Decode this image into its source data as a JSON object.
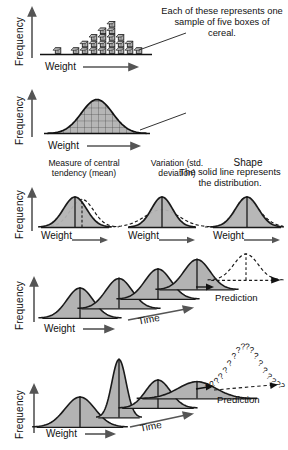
{
  "figure": {
    "title_hidden": "",
    "axis_labels": {
      "frequency": "Frequency",
      "weight": "Weight",
      "time": "Time"
    },
    "colors": {
      "curve_fill": "#b3b3b3",
      "curve_stroke": "#1a1a1a",
      "block_fill": "#b0b0b0",
      "text": "#111111",
      "background": "#ffffff"
    }
  },
  "panels": [
    {
      "id": "panel-histogram-blocks",
      "ylabel": "Frequency",
      "xlabel": "Weight",
      "caption": "Each of these represents one sample of five boxes of cereal.",
      "chart_data": {
        "type": "bar",
        "title": "",
        "xlabel": "Weight",
        "ylabel": "Frequency",
        "categories": [
          "1",
          "2",
          "3",
          "4",
          "5",
          "6",
          "7",
          "8",
          "9",
          "10",
          "11"
        ],
        "values": [
          0,
          1,
          0,
          1,
          2,
          3,
          4,
          5,
          3,
          2,
          1
        ],
        "unit": "blocks",
        "grid": false,
        "note": "each block = one sample of five boxes"
      }
    },
    {
      "id": "panel-distribution-curve",
      "ylabel": "Frequency",
      "xlabel": "Weight",
      "caption": "The solid line represents the distribution.",
      "chart_data": {
        "type": "area",
        "title": "",
        "xlabel": "Weight",
        "ylabel": "Frequency",
        "x": [
          0,
          1,
          2,
          3,
          4,
          5,
          6,
          7,
          8,
          9,
          10,
          11,
          12
        ],
        "values": [
          0.02,
          0.06,
          0.16,
          0.34,
          0.62,
          0.88,
          1.0,
          0.88,
          0.62,
          0.34,
          0.16,
          0.06,
          0.02
        ],
        "grid": true,
        "note": "normal distribution over gridded histogram"
      }
    },
    {
      "id": "panel-three-properties",
      "ylabel": "Frequency",
      "subpanels": [
        {
          "id": "subpanel-central-tendency",
          "heading": "Measure of central tendency (mean)",
          "xlabel": "Weight",
          "chart_data": {
            "type": "line",
            "title": "Measure of central tendency (mean)",
            "xlabel": "Weight",
            "ylabel": "Frequency",
            "series": [
              {
                "name": "solid",
                "mean": 0,
                "sd": 1,
                "style": "solid",
                "filled": true
              },
              {
                "name": "dashed",
                "mean": 0.45,
                "sd": 1,
                "style": "dashed",
                "filled": false
              }
            ]
          }
        },
        {
          "id": "subpanel-variation",
          "heading": "Variation (std. deviation)",
          "xlabel": "Weight",
          "chart_data": {
            "type": "line",
            "title": "Variation (std. deviation)",
            "xlabel": "Weight",
            "ylabel": "Frequency",
            "series": [
              {
                "name": "solid",
                "mean": 0,
                "sd": 1,
                "style": "solid",
                "filled": true
              },
              {
                "name": "dashed",
                "mean": 0,
                "sd": 1.8,
                "style": "dashed",
                "filled": false
              }
            ]
          }
        },
        {
          "id": "subpanel-shape",
          "heading": "Shape",
          "xlabel": "Weight",
          "chart_data": {
            "type": "line",
            "title": "Shape",
            "xlabel": "Weight",
            "ylabel": "Frequency",
            "series": [
              {
                "name": "solid",
                "skew": 0,
                "style": "solid",
                "filled": true
              },
              {
                "name": "dashed",
                "skew": -1,
                "style": "dashed",
                "filled": false
              }
            ]
          }
        }
      ]
    },
    {
      "id": "panel-stable-process",
      "ylabel": "Frequency",
      "xlabel": "Weight",
      "timelabel": "Time",
      "prediction_label": "Prediction",
      "chart_data": {
        "type": "line",
        "title": "",
        "xlabel": "Weight",
        "ylabel": "Frequency",
        "zlabel": "Time",
        "series": [
          {
            "name": "t1",
            "style": "solid",
            "filled": true,
            "height": 1.0,
            "width": 1.0
          },
          {
            "name": "t2",
            "style": "solid",
            "filled": true,
            "height": 1.0,
            "width": 1.0
          },
          {
            "name": "t3",
            "style": "solid",
            "filled": true,
            "height": 1.0,
            "width": 1.0
          },
          {
            "name": "t4",
            "style": "solid",
            "filled": true,
            "height": 1.0,
            "width": 1.0
          },
          {
            "name": "prediction",
            "style": "dashed",
            "filled": false,
            "height": 1.0,
            "width": 1.0
          }
        ],
        "note": "stable process: identical distributions over time allow prediction"
      }
    },
    {
      "id": "panel-unstable-process",
      "ylabel": "Frequency",
      "xlabel": "Weight",
      "timelabel": "Time",
      "prediction_label": "Prediction",
      "question_marks": "??????????????????",
      "chart_data": {
        "type": "line",
        "title": "",
        "xlabel": "Weight",
        "ylabel": "Frequency",
        "zlabel": "Time",
        "series": [
          {
            "name": "t1",
            "style": "solid",
            "filled": true,
            "height": 0.75,
            "width": 1.15
          },
          {
            "name": "t2",
            "style": "solid",
            "filled": true,
            "height": 1.45,
            "width": 0.55
          },
          {
            "name": "t3",
            "style": "solid",
            "filled": true,
            "height": 0.7,
            "width": 0.95
          },
          {
            "name": "t4",
            "style": "solid",
            "filled": true,
            "height": 0.42,
            "width": 1.45
          },
          {
            "name": "prediction",
            "style": "question-marks",
            "filled": false
          }
        ],
        "note": "unstable process: changing distributions make prediction impossible"
      }
    }
  ]
}
